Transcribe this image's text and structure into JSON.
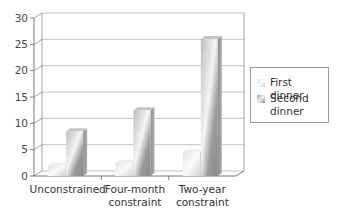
{
  "chart_data": {
    "type": "bar",
    "style": "3d-clustered-column",
    "title": "",
    "xlabel": "",
    "ylabel": "",
    "ylim": [
      0,
      30
    ],
    "yticks": [
      0,
      5,
      10,
      15,
      20,
      25,
      30
    ],
    "grid": true,
    "legend_position": "right",
    "categories": [
      "Unconstrained",
      "Four-month constraint",
      "Two-year constraint"
    ],
    "category_lines": [
      [
        "Unconstrained"
      ],
      [
        "Four-month",
        "constraint"
      ],
      [
        "Two-year",
        "constraint"
      ]
    ],
    "series": [
      {
        "name": "First dinner",
        "values": [
          2,
          2.5,
          4.5
        ],
        "color": "#e8e8e8"
      },
      {
        "name": "Second dinner",
        "values": [
          8.5,
          12.5,
          26
        ],
        "color": "#a8a8a8"
      }
    ]
  },
  "legend": {
    "items": [
      {
        "label_lines": [
          "First dinner"
        ]
      },
      {
        "label_lines": [
          "Second",
          "dinner"
        ]
      }
    ]
  }
}
